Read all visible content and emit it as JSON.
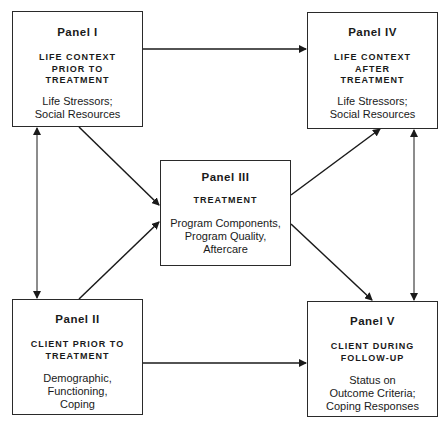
{
  "diagram": {
    "panels": [
      {
        "id": "panel-1",
        "title": "Panel I",
        "heading": [
          "LIFE CONTEXT",
          "PRIOR TO",
          "TREATMENT"
        ],
        "body": [
          "Life Stressors;",
          "Social Resources"
        ]
      },
      {
        "id": "panel-2",
        "title": "Panel II",
        "heading": [
          "CLIENT PRIOR TO",
          "TREATMENT"
        ],
        "body": [
          "Demographic,",
          "Functioning,",
          "Coping"
        ]
      },
      {
        "id": "panel-3",
        "title": "Panel III",
        "heading": [
          "TREATMENT"
        ],
        "body": [
          "Program Components,",
          "Program Quality,",
          "Aftercare"
        ]
      },
      {
        "id": "panel-4",
        "title": "Panel IV",
        "heading": [
          "LIFE CONTEXT",
          "AFTER",
          "TREATMENT"
        ],
        "body": [
          "Life Stressors;",
          "Social Resources"
        ]
      },
      {
        "id": "panel-5",
        "title": "Panel V",
        "heading": [
          "CLIENT DURING",
          "FOLLOW-UP"
        ],
        "body": [
          "Status on",
          "Outcome Criteria;",
          "Coping Responses"
        ]
      }
    ],
    "edges": [
      {
        "from": "Panel I",
        "to": "Panel IV",
        "type": "directed"
      },
      {
        "from": "Panel I",
        "to": "Panel III",
        "type": "directed"
      },
      {
        "from": "Panel I",
        "to": "Panel II",
        "type": "bidirectional"
      },
      {
        "from": "Panel II",
        "to": "Panel III",
        "type": "directed"
      },
      {
        "from": "Panel II",
        "to": "Panel V",
        "type": "directed"
      },
      {
        "from": "Panel III",
        "to": "Panel IV",
        "type": "directed"
      },
      {
        "from": "Panel III",
        "to": "Panel V",
        "type": "directed"
      },
      {
        "from": "Panel IV",
        "to": "Panel V",
        "type": "bidirectional"
      }
    ],
    "colors": {
      "line": "#1a1a1a",
      "background": "#ffffff"
    }
  },
  "caption": ""
}
